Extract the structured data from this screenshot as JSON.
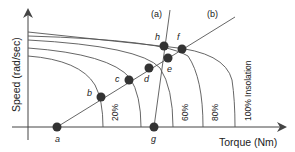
{
  "diagram": {
    "type": "solar-pv-motor-torque-speed",
    "y_axis_label": "Speed (rad/sec)",
    "x_axis_label": "Torque (Nm)",
    "line_labels": {
      "a": "(a)",
      "b": "(b)"
    },
    "curves": [
      {
        "label": "20%",
        "y_start": 56,
        "x_end": 103
      },
      {
        "label": "",
        "y_start": 48,
        "x_end": 141
      },
      {
        "label": "60%",
        "y_start": 40,
        "x_end": 173
      },
      {
        "label": "80%",
        "y_start": 36,
        "x_end": 203
      },
      {
        "label": "100% Insolation",
        "y_start": 32,
        "x_end": 235
      }
    ],
    "points": [
      {
        "name": "a",
        "x": 57,
        "y": 127
      },
      {
        "name": "b",
        "x": 101,
        "y": 97
      },
      {
        "name": "c",
        "x": 129,
        "y": 80
      },
      {
        "name": "d",
        "x": 149,
        "y": 68
      },
      {
        "name": "e",
        "x": 168,
        "y": 58
      },
      {
        "name": "f",
        "x": 182,
        "y": 49
      },
      {
        "name": "h",
        "x": 164,
        "y": 46
      },
      {
        "name": "g",
        "x": 154,
        "y": 127
      }
    ],
    "colors": {
      "line": "#444444",
      "point": "#333333",
      "text": "#222222"
    }
  }
}
